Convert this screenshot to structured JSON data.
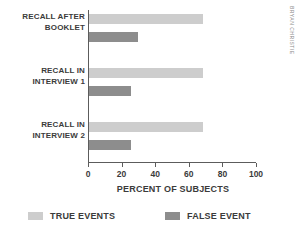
{
  "chart_data": {
    "type": "bar",
    "orientation": "horizontal",
    "title": "",
    "xlabel": "PERCENT OF SUBJECTS",
    "ylabel": "",
    "xlim": [
      0,
      100
    ],
    "xticks": [
      0,
      20,
      40,
      60,
      80,
      100
    ],
    "grid": false,
    "legend_position": "bottom",
    "categories": [
      "RECALL AFTER BOOKLET",
      "RECALL IN INTERVIEW 1",
      "RECALL IN INTERVIEW 2"
    ],
    "category_lines": [
      {
        "line1": "RECALL AFTER",
        "line2": "BOOKLET"
      },
      {
        "line1": "RECALL IN",
        "line2": "INTERVIEW 1"
      },
      {
        "line1": "RECALL IN",
        "line2": "INTERVIEW 2"
      }
    ],
    "series": [
      {
        "name": "TRUE EVENTS",
        "color": "#cdcdcd",
        "values": [
          68,
          68,
          68
        ]
      },
      {
        "name": "FALSE EVENT",
        "color": "#8d8d8d",
        "values": [
          29,
          25,
          25
        ]
      }
    ]
  },
  "axis": {
    "tick_labels": [
      "0",
      "20",
      "40",
      "60",
      "80",
      "100"
    ],
    "x_title": "PERCENT OF SUBJECTS"
  },
  "legend": {
    "items": [
      {
        "label": "TRUE EVENTS"
      },
      {
        "label": "FALSE EVENT"
      }
    ]
  },
  "credit": {
    "text": "BRYAN CHRISTIE"
  }
}
